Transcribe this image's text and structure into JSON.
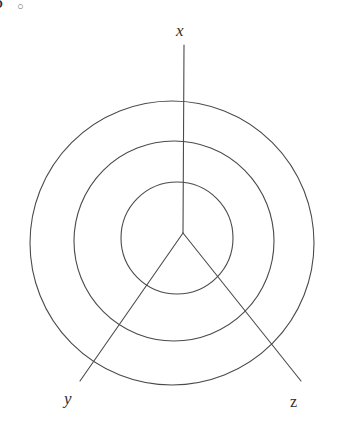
{
  "figure": {
    "width": 341,
    "height": 438,
    "background_color": "#ffffff",
    "stroke_color": "#4a4a4a",
    "stroke_width": 1.1
  },
  "corner_marks": {
    "cropped_glyph": "5",
    "degree_symbol": "○"
  },
  "axes": [
    {
      "id": "x",
      "label": "x",
      "style": "italic",
      "origin": {
        "x": 183,
        "y": 233
      },
      "end": {
        "x": 184,
        "y": 45
      },
      "label_pos": {
        "x": 183,
        "y": 33
      }
    },
    {
      "id": "y",
      "label": "y",
      "style": "italic",
      "origin": {
        "x": 183,
        "y": 233
      },
      "end": {
        "x": 80,
        "y": 381
      },
      "label_pos": {
        "x": 71,
        "y": 402
      }
    },
    {
      "id": "z",
      "label": "z",
      "style": "roman",
      "origin": {
        "x": 183,
        "y": 233
      },
      "end": {
        "x": 301,
        "y": 381
      },
      "label_pos": {
        "x": 297,
        "y": 406
      }
    }
  ],
  "circles": [
    {
      "id": "outer-circle",
      "cx": 172,
      "cy": 243,
      "r": 142
    },
    {
      "id": "middle-circle",
      "cx": 174,
      "cy": 241,
      "r": 100
    },
    {
      "id": "inner-circle",
      "cx": 177,
      "cy": 238,
      "r": 56
    }
  ],
  "chart_data": {
    "type": "scatter",
    "xlabel": "",
    "ylabel": "",
    "grid": false,
    "legend": null,
    "annotations": [
      {
        "text": "x",
        "role": "axis-label",
        "x": 183,
        "y": 33
      },
      {
        "text": "y",
        "role": "axis-label",
        "x": 71,
        "y": 402
      },
      {
        "text": "z",
        "role": "axis-label",
        "x": 297,
        "y": 406
      }
    ],
    "series": [
      {
        "name": "x-axis",
        "type": "line",
        "x": [
          183,
          184
        ],
        "y": [
          233,
          45
        ]
      },
      {
        "name": "y-axis",
        "type": "line",
        "x": [
          183,
          80
        ],
        "y": [
          233,
          381
        ]
      },
      {
        "name": "z-axis",
        "type": "line",
        "x": [
          183,
          301
        ],
        "y": [
          233,
          381
        ]
      },
      {
        "name": "inner-circle",
        "type": "circle",
        "center": [
          177,
          238
        ],
        "radius": 56
      },
      {
        "name": "middle-circle",
        "type": "circle",
        "center": [
          174,
          241
        ],
        "radius": 100
      },
      {
        "name": "outer-circle",
        "type": "circle",
        "center": [
          172,
          243
        ],
        "radius": 142
      }
    ]
  }
}
